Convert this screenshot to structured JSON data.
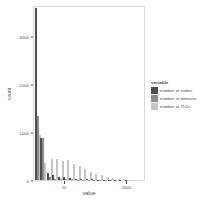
{
  "chart_data": {
    "type": "bar",
    "title": "",
    "xlabel": "value",
    "ylabel": "count",
    "xscale": "log10",
    "yscale": "linear",
    "ylim": [
      0,
      3650
    ],
    "xlim_log": [
      0.0,
      3.6
    ],
    "grid": false,
    "legend_position": "right",
    "legend_title": "variable",
    "yticks": [
      0,
      1000,
      2000,
      3000
    ],
    "ytick_labels": [
      "0",
      "1000",
      "2000",
      "3000"
    ],
    "xticks_log": [
      1,
      3
    ],
    "xtick_labels": [
      "10",
      "1000"
    ],
    "series": [
      {
        "name": "number of nodes",
        "color": "#4d4d4d",
        "values": [
          3580,
          880,
          150,
          95,
          70,
          55,
          40,
          30,
          22,
          16,
          11,
          8,
          6,
          4,
          3,
          2,
          2,
          1
        ]
      },
      {
        "name": "number of domains",
        "color": "#8c8c8c",
        "values": [
          1330,
          870,
          60,
          30,
          20,
          16,
          12,
          9,
          7,
          5,
          4,
          3,
          2,
          2,
          1,
          1,
          1,
          0
        ]
      },
      {
        "name": "number of TLDs",
        "color": "#c4c4c4",
        "values": [
          930,
          350,
          440,
          430,
          400,
          420,
          330,
          300,
          230,
          170,
          130,
          95,
          70,
          45,
          28,
          16,
          9,
          5
        ]
      }
    ],
    "bin_centers_log": [
      0.12,
      0.3,
      0.5,
      0.68,
      0.86,
      1.04,
      1.22,
      1.4,
      1.58,
      1.76,
      1.94,
      2.12,
      2.3,
      2.48,
      2.66,
      2.84,
      3.02,
      3.2
    ]
  },
  "axes": {
    "y_title": "count",
    "x_title": "value"
  },
  "legend": {
    "title": "variable",
    "items": [
      {
        "label": "number of nodes",
        "color": "#4d4d4d"
      },
      {
        "label": "number of domains",
        "color": "#8c8c8c"
      },
      {
        "label": "number of TLDs",
        "color": "#c4c4c4"
      }
    ]
  },
  "caption": {
    "text": ""
  }
}
